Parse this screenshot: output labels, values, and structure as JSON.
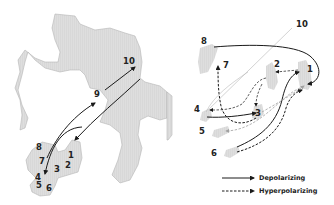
{
  "left_panel": {
    "labels": [
      {
        "id": "1",
        "text": "1",
        "x": 72,
        "y": 157
      },
      {
        "id": "2",
        "text": "2",
        "x": 68,
        "y": 167
      },
      {
        "id": "3",
        "text": "3",
        "x": 57,
        "y": 172
      },
      {
        "id": "4",
        "text": "4",
        "x": 38,
        "y": 180
      },
      {
        "id": "5",
        "text": "5",
        "x": 40,
        "y": 188
      },
      {
        "id": "6",
        "text": "6",
        "x": 49,
        "y": 190
      },
      {
        "id": "7",
        "text": "7",
        "x": 42,
        "y": 164
      },
      {
        "id": "8",
        "text": "8",
        "x": 39,
        "y": 149
      },
      {
        "id": "9",
        "text": "9",
        "x": 97,
        "y": 97
      },
      {
        "id": "10",
        "text": "10",
        "x": 129,
        "y": 64
      }
    ],
    "arrows": [
      {
        "from": "7",
        "to": "9",
        "type": "depolarizing"
      },
      {
        "from": "9",
        "to": "10",
        "type": "depolarizing"
      },
      {
        "from": "10",
        "to": "1",
        "type": "depolarizing"
      },
      {
        "from": "10",
        "to": "4",
        "type": "depolarizing"
      }
    ]
  },
  "right_panel": {
    "labels": [
      {
        "id": "1",
        "text": "1",
        "x": 310,
        "y": 71
      },
      {
        "id": "2",
        "text": "2",
        "x": 277,
        "y": 67
      },
      {
        "id": "3",
        "text": "3",
        "x": 258,
        "y": 114
      },
      {
        "id": "4",
        "text": "4",
        "x": 197,
        "y": 112
      },
      {
        "id": "5",
        "text": "5",
        "x": 202,
        "y": 133
      },
      {
        "id": "6",
        "text": "6",
        "x": 214,
        "y": 155
      },
      {
        "id": "7",
        "text": "7",
        "x": 226,
        "y": 67
      },
      {
        "id": "8",
        "text": "8",
        "x": 204,
        "y": 44
      },
      {
        "id": "10",
        "text": "10",
        "x": 297,
        "y": 27
      }
    ],
    "arrows": [
      {
        "from": "8",
        "to": "1",
        "type": "depolarizing"
      },
      {
        "from": "4",
        "to": "3",
        "type": "depolarizing"
      },
      {
        "from": "6",
        "to": "1",
        "type": "depolarizing"
      },
      {
        "from": "6",
        "to": "1",
        "type": "hyperpolarizing"
      },
      {
        "from": "1",
        "to": "2",
        "type": "hyperpolarizing"
      },
      {
        "from": "2",
        "to": "3",
        "type": "hyperpolarizing"
      },
      {
        "from": "2",
        "to": "4",
        "type": "hyperpolarizing"
      },
      {
        "from": "3",
        "to": "7",
        "type": "hyperpolarizing"
      },
      {
        "from": "1",
        "to": "5",
        "type": "hyperpolarizing"
      },
      {
        "from": "4",
        "to": "1",
        "type": "hyperpolarizing"
      }
    ]
  },
  "legend": {
    "depolarizing": "Depolarizing",
    "hyperpolarizing": "Hyperpolarizing"
  },
  "colors": {
    "protein_fill": "#dcdcdc",
    "protein_stroke": "#b5b5b5",
    "arrow_dark": "#1a1a1a",
    "arrow_light": "#a8a8a8",
    "axis_line": "#c8c8c8"
  }
}
